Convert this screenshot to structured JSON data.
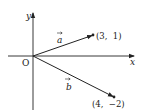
{
  "diagram": {
    "title": "",
    "axes": {
      "x_label": "x",
      "y_label": "y",
      "origin_label": "O"
    },
    "vectors": [
      {
        "name": "a",
        "label": "a",
        "endpoint": [
          3,
          1
        ],
        "endpoint_label": "(3,  1)"
      },
      {
        "name": "b",
        "label": "b",
        "endpoint": [
          4,
          -2
        ],
        "endpoint_label": "(4,  −2)"
      }
    ],
    "colors": {
      "line": "#222222",
      "background": "#ffffff"
    }
  }
}
